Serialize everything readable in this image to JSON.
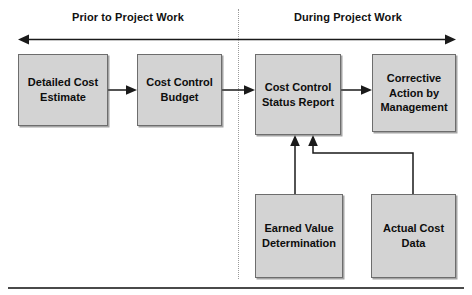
{
  "diagram": {
    "title_visible": false,
    "phases": [
      {
        "id": "prior",
        "label": "Prior to Project Work"
      },
      {
        "id": "during",
        "label": "During Project Work"
      }
    ],
    "boxes": [
      {
        "id": "detailed-cost-estimate",
        "label": "Detailed Cost\nEstimate"
      },
      {
        "id": "cost-control-budget",
        "label": "Cost Control\nBudget"
      },
      {
        "id": "cost-control-status-report",
        "label": "Cost Control\nStatus Report"
      },
      {
        "id": "corrective-action-by-management",
        "label": "Corrective\nAction by\nManagement"
      },
      {
        "id": "earned-value-determination",
        "label": "Earned Value\nDetermination"
      },
      {
        "id": "actual-cost-data",
        "label": "Actual Cost\nData"
      }
    ],
    "colors": {
      "box_fill": "#d3d3d3",
      "box_border": "#6d6d6d",
      "connector": "#1a1a1a",
      "divider": "#9a9a9a",
      "rule": "#4a4a4a",
      "text": "#0d0d0d",
      "background": "#ffffff"
    }
  }
}
